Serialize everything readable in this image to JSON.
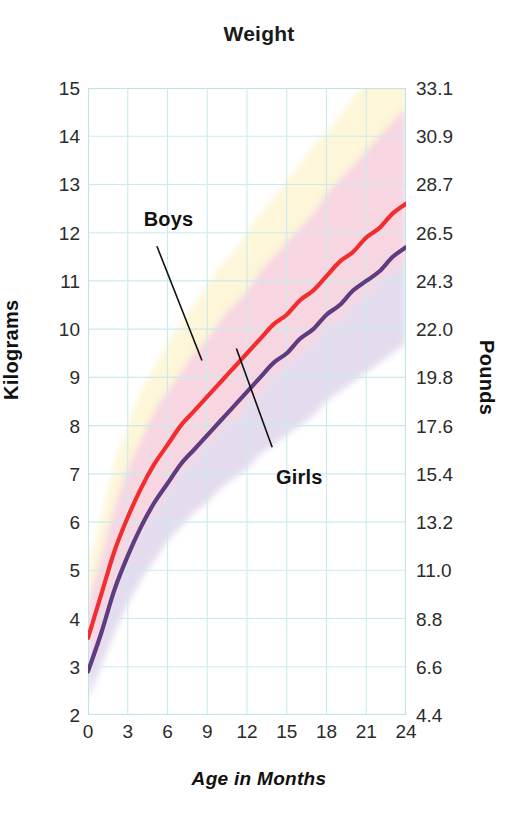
{
  "chart_data": {
    "type": "line",
    "title": "Weight",
    "xlabel": "Age in Months",
    "ylabel": "Kilograms",
    "ylabel_secondary": "Pounds",
    "grid": true,
    "legend_position": "inline-callout",
    "xlim": [
      0,
      24
    ],
    "ylim": [
      2,
      15
    ],
    "ylim_secondary": [
      4.4,
      33.1
    ],
    "x_ticks": [
      "0",
      "3",
      "6",
      "9",
      "12",
      "15",
      "18",
      "21",
      "24"
    ],
    "x_tick_values": [
      0,
      3,
      6,
      9,
      12,
      15,
      18,
      21,
      24
    ],
    "y_ticks": [
      "15",
      "14",
      "13",
      "12",
      "11",
      "10",
      "9",
      "8",
      "7",
      "6",
      "5",
      "4",
      "3",
      "2"
    ],
    "y_tick_values": [
      15,
      14,
      13,
      12,
      11,
      10,
      9,
      8,
      7,
      6,
      5,
      4,
      3,
      2
    ],
    "y_ticks_secondary": [
      "33.1",
      "30.9",
      "28.7",
      "26.5",
      "24.3",
      "22.0",
      "19.8",
      "17.6",
      "15.4",
      "13.2",
      "11.0",
      "8.8",
      "6.6",
      "4.4"
    ],
    "y_tick_values_secondary": [
      33.1,
      30.9,
      28.7,
      26.5,
      24.3,
      22.0,
      19.8,
      17.6,
      15.4,
      13.2,
      11.0,
      8.8,
      6.6,
      4.4
    ],
    "x": [
      0,
      1,
      2,
      3,
      4,
      5,
      6,
      7,
      8,
      9,
      10,
      11,
      12,
      13,
      14,
      15,
      16,
      17,
      18,
      19,
      20,
      21,
      22,
      23,
      24
    ],
    "series": [
      {
        "name": "Boys",
        "color": "#f22d2d",
        "values": [
          3.6,
          4.5,
          5.4,
          6.1,
          6.7,
          7.2,
          7.6,
          8.0,
          8.3,
          8.6,
          8.9,
          9.2,
          9.5,
          9.8,
          10.1,
          10.3,
          10.6,
          10.8,
          11.1,
          11.4,
          11.6,
          11.9,
          12.1,
          12.4,
          12.6
        ]
      },
      {
        "name": "Girls",
        "color": "#5d3d80",
        "values": [
          2.9,
          3.7,
          4.6,
          5.3,
          5.9,
          6.4,
          6.8,
          7.2,
          7.5,
          7.8,
          8.1,
          8.4,
          8.7,
          9.0,
          9.3,
          9.5,
          9.8,
          10.0,
          10.3,
          10.5,
          10.8,
          11.0,
          11.2,
          11.5,
          11.7
        ]
      }
    ],
    "bands": [
      {
        "name": "upper-outer-band",
        "color": "#fdf6d8",
        "upper": [
          5.1,
          6.1,
          7.2,
          8.0,
          8.7,
          9.2,
          9.7,
          10.1,
          10.5,
          10.9,
          11.3,
          11.6,
          12.0,
          12.4,
          12.7,
          13.1,
          13.4,
          13.8,
          14.1,
          14.4,
          14.8,
          15.1,
          15.4,
          15.7,
          16.0
        ],
        "lower": [
          4.3,
          5.3,
          6.3,
          7.1,
          7.7,
          8.3,
          8.7,
          9.1,
          9.5,
          9.8,
          10.2,
          10.5,
          10.8,
          11.2,
          11.5,
          11.8,
          12.1,
          12.4,
          12.8,
          13.1,
          13.4,
          13.7,
          14.0,
          14.3,
          14.6
        ]
      },
      {
        "name": "boys-inner-band",
        "color": "#f7d6e2",
        "upper": [
          4.3,
          5.3,
          6.3,
          7.1,
          7.7,
          8.3,
          8.7,
          9.1,
          9.5,
          9.8,
          10.2,
          10.5,
          10.8,
          11.2,
          11.5,
          11.8,
          12.1,
          12.4,
          12.8,
          13.1,
          13.4,
          13.7,
          14.0,
          14.3,
          14.6
        ],
        "lower": [
          3.0,
          3.8,
          4.6,
          5.3,
          5.8,
          6.2,
          6.6,
          7.0,
          7.3,
          7.6,
          7.9,
          8.1,
          8.4,
          8.7,
          9.0,
          9.2,
          9.5,
          9.7,
          10.0,
          10.2,
          10.5,
          10.7,
          11.0,
          11.2,
          11.4
        ]
      },
      {
        "name": "girls-lower-band",
        "color": "#e4dcee",
        "upper": [
          3.0,
          3.8,
          4.6,
          5.3,
          5.8,
          6.2,
          6.6,
          7.0,
          7.3,
          7.6,
          7.9,
          8.1,
          8.4,
          8.7,
          9.0,
          9.2,
          9.5,
          9.7,
          10.0,
          10.2,
          10.5,
          10.7,
          11.0,
          11.2,
          11.4
        ],
        "lower": [
          2.3,
          3.0,
          3.7,
          4.3,
          4.8,
          5.2,
          5.6,
          5.9,
          6.2,
          6.4,
          6.7,
          6.9,
          7.1,
          7.4,
          7.6,
          7.8,
          8.0,
          8.2,
          8.5,
          8.7,
          8.9,
          9.1,
          9.3,
          9.5,
          9.7
        ]
      }
    ],
    "annotations": [
      {
        "name": "Boys",
        "label_x": 4.2,
        "label_y": 12.25,
        "leader_from": [
          5.2,
          11.72
        ],
        "leader_to": [
          8.6,
          9.35
        ]
      },
      {
        "name": "Girls",
        "label_x": 14.2,
        "label_y": 6.9,
        "leader_from": [
          13.9,
          7.55
        ],
        "leader_to": [
          11.2,
          9.6
        ]
      }
    ],
    "grid_color": "#c8ecee",
    "axis_color": "#bde4e8"
  }
}
